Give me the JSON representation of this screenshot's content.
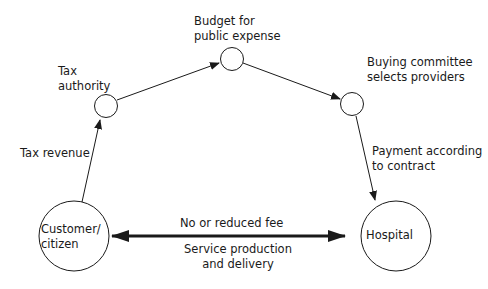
{
  "diagram": {
    "nodes": [
      {
        "id": "tax_authority",
        "label": "Tax\nauthority"
      },
      {
        "id": "budget",
        "label": "Budget for\npublic expense"
      },
      {
        "id": "buying_committee",
        "label": "Buying committee\nselects providers"
      },
      {
        "id": "customer",
        "label": "Customer/\ncitizen"
      },
      {
        "id": "hospital",
        "label": "Hospital"
      }
    ],
    "edges": [
      {
        "from": "customer",
        "to": "tax_authority",
        "label": "Tax revenue"
      },
      {
        "from": "tax_authority",
        "to": "budget",
        "label": ""
      },
      {
        "from": "budget",
        "to": "buying_committee",
        "label": ""
      },
      {
        "from": "buying_committee",
        "to": "hospital",
        "label": "Payment according\nto contract"
      },
      {
        "from": "customer",
        "to": "hospital",
        "bidirectional": true,
        "label_top": "No or reduced fee",
        "label_bottom": "Service production\nand delivery"
      }
    ],
    "colors": {
      "stroke": "#1a1a1a",
      "background": "#ffffff"
    }
  }
}
